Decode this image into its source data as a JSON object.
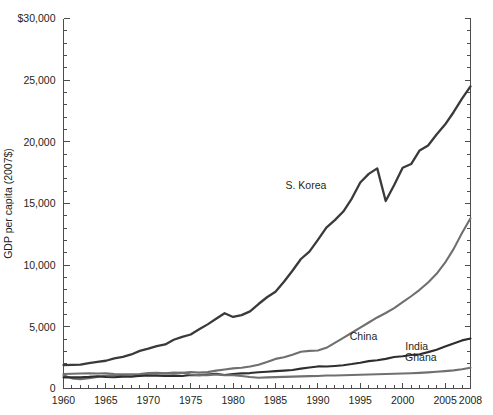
{
  "chart_data": {
    "type": "line",
    "title": "",
    "xlabel": "",
    "ylabel": "GDP per capita (2007$)",
    "xlim": [
      1960,
      2008
    ],
    "ylim": [
      0,
      30000
    ],
    "grid": false,
    "legend_position": "inline-labels",
    "y_ticks_major": [
      0,
      5000,
      10000,
      15000,
      20000,
      25000,
      30000
    ],
    "y_tick_labels": [
      "0",
      "5,000",
      "10,000",
      "15,000",
      "20,000",
      "25,000",
      "$30,000"
    ],
    "y_tick_minor_step": 1000,
    "x_ticks_major": [
      1960,
      1965,
      1970,
      1975,
      1980,
      1985,
      1990,
      1995,
      2000,
      2005,
      2008
    ],
    "x_tick_labels": [
      "1960",
      "1965",
      "1970",
      "1975",
      "1980",
      "1985",
      "1990",
      "1995",
      "2000",
      "2005",
      "2008"
    ],
    "x_tick_minor_step": 1,
    "x": [
      1960,
      1961,
      1962,
      1963,
      1964,
      1965,
      1966,
      1967,
      1968,
      1969,
      1970,
      1971,
      1972,
      1973,
      1974,
      1975,
      1976,
      1977,
      1978,
      1979,
      1980,
      1981,
      1982,
      1983,
      1984,
      1985,
      1986,
      1987,
      1988,
      1989,
      1990,
      1991,
      1992,
      1993,
      1994,
      1995,
      1996,
      1997,
      1998,
      1999,
      2000,
      2001,
      2002,
      2003,
      2004,
      2005,
      2006,
      2007,
      2008
    ],
    "series": [
      {
        "name": "S. Korea",
        "color": "#3a3a3a",
        "width": 2.3,
        "label_x": 1991,
        "label_y": 16200,
        "label_anchor": "end",
        "values": [
          1900,
          1920,
          1940,
          2050,
          2150,
          2250,
          2450,
          2560,
          2760,
          3050,
          3230,
          3440,
          3570,
          3950,
          4180,
          4380,
          4800,
          5200,
          5650,
          6100,
          5800,
          5950,
          6250,
          6850,
          7400,
          7850,
          8650,
          9550,
          10500,
          11100,
          12050,
          13050,
          13650,
          14350,
          15400,
          16700,
          17400,
          17850,
          15200,
          16500,
          17900,
          18200,
          19300,
          19700,
          20600,
          21400,
          22400,
          23500,
          24500
        ]
      },
      {
        "name": "China",
        "color": "#6f6f6f",
        "width": 2.1,
        "label_x": 1997,
        "label_y": 3900,
        "label_anchor": "end",
        "values": [
          1080,
          820,
          760,
          830,
          940,
          1030,
          1080,
          1010,
          960,
          1060,
          1200,
          1240,
          1230,
          1290,
          1270,
          1340,
          1290,
          1330,
          1450,
          1540,
          1630,
          1680,
          1790,
          1930,
          2150,
          2400,
          2530,
          2740,
          2980,
          3050,
          3080,
          3300,
          3700,
          4100,
          4520,
          4940,
          5350,
          5760,
          6120,
          6520,
          7000,
          7480,
          8000,
          8600,
          9300,
          10200,
          11300,
          12600,
          13800
        ]
      },
      {
        "name": "India",
        "color": "#2e2e2e",
        "width": 2.1,
        "label_x": 2003,
        "label_y": 3150,
        "label_anchor": "end",
        "values": [
          900,
          900,
          910,
          940,
          990,
          930,
          910,
          960,
          970,
          1020,
          1060,
          1040,
          1010,
          1040,
          1010,
          1090,
          1080,
          1140,
          1190,
          1100,
          1180,
          1230,
          1250,
          1320,
          1360,
          1410,
          1450,
          1500,
          1610,
          1700,
          1790,
          1780,
          1830,
          1890,
          1980,
          2090,
          2220,
          2290,
          2400,
          2550,
          2620,
          2720,
          2770,
          2950,
          3150,
          3400,
          3650,
          3900,
          4050
        ]
      },
      {
        "name": "Ghana",
        "color": "#707070",
        "width": 2.1,
        "label_x": 2004,
        "label_y": 2250,
        "label_anchor": "end",
        "values": [
          1180,
          1200,
          1220,
          1230,
          1220,
          1230,
          1170,
          1160,
          1160,
          1180,
          1250,
          1280,
          1230,
          1230,
          1270,
          1130,
          1080,
          1080,
          1130,
          1080,
          1080,
          1010,
          930,
          870,
          900,
          920,
          940,
          960,
          980,
          1000,
          1010,
          1050,
          1060,
          1080,
          1090,
          1110,
          1130,
          1150,
          1180,
          1200,
          1220,
          1240,
          1270,
          1310,
          1360,
          1410,
          1470,
          1560,
          1680
        ]
      }
    ]
  }
}
